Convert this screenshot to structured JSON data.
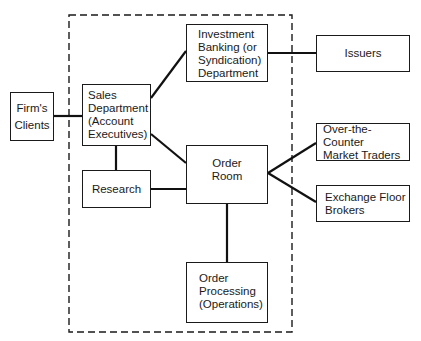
{
  "diagram": {
    "boundary": {
      "style": "dashed",
      "label": ""
    },
    "nodes": {
      "firms_clients": {
        "label": "Firm's\nClients"
      },
      "sales_department": {
        "label": "Sales\nDepartment\n(Account\nExecutives)"
      },
      "investment_banking": {
        "label": "Investment\nBanking  (or\nSyndication)\nDepartment"
      },
      "issuers": {
        "label": "Issuers"
      },
      "order_room": {
        "label": "Order\nRoom"
      },
      "research": {
        "label": "Research"
      },
      "otc_traders": {
        "label": "Over-the-Counter\nMarket Traders"
      },
      "exchange_floor_brokers": {
        "label": "Exchange Floor\nBrokers"
      },
      "order_processing": {
        "label": "Order\nProcessing\n(Operations)"
      }
    },
    "edges": [
      {
        "from": "Firm's Clients",
        "to": "Sales Department (Account Executives)"
      },
      {
        "from": "Sales Department (Account Executives)",
        "to": "Investment Banking (or Syndication) Department"
      },
      {
        "from": "Sales Department (Account Executives)",
        "to": "Order Room"
      },
      {
        "from": "Sales Department (Account Executives)",
        "to": "Research"
      },
      {
        "from": "Investment Banking (or Syndication) Department",
        "to": "Issuers"
      },
      {
        "from": "Research",
        "to": "Order Room"
      },
      {
        "from": "Order Room",
        "to": "Over-the-Counter Market Traders"
      },
      {
        "from": "Order Room",
        "to": "Exchange Floor Brokers"
      },
      {
        "from": "Order Room",
        "to": "Order Processing (Operations)"
      }
    ]
  }
}
